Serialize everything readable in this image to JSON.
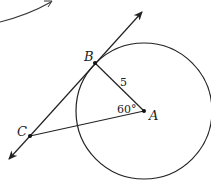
{
  "diagram": {
    "type": "geometry",
    "colors": {
      "stroke": "#222222",
      "background": "#ffffff"
    },
    "points": {
      "A": {
        "label": "A",
        "x": 144,
        "y": 111
      },
      "B": {
        "label": "B",
        "x": 95,
        "y": 63
      },
      "C": {
        "label": "C",
        "x": 30,
        "y": 136
      }
    },
    "circle": {
      "center": "A",
      "radius": 68
    },
    "segments": [
      {
        "from": "A",
        "to": "B",
        "label": "5"
      },
      {
        "from": "A",
        "to": "C",
        "label": ""
      }
    ],
    "tangent_line": {
      "through": [
        "B",
        "C"
      ],
      "arrows": "both",
      "tangent_at": "B"
    },
    "angle": {
      "vertex": "A",
      "between": [
        "B",
        "C"
      ],
      "label": "60°"
    },
    "labels": {
      "A": "A",
      "B": "B",
      "C": "C",
      "AB_length": "5",
      "angle_A": "60°"
    },
    "decorations": [
      {
        "type": "curved-arrow",
        "location": "top-left",
        "direction": "up-right"
      }
    ]
  }
}
